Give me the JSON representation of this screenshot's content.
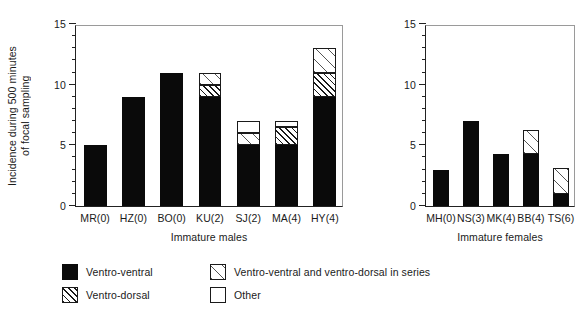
{
  "chart_data": {
    "type": "bar",
    "subtype": "stacked",
    "title": "",
    "xlabel": "",
    "ylabel": "Incidence during 500 minutes\nof focal sampling",
    "ylim": [
      0,
      15
    ],
    "ytick_values": [
      0,
      5,
      10,
      15
    ],
    "ytick_labels": [
      "0",
      "5",
      "10",
      "15"
    ],
    "ytick_minor_step": 1,
    "grid": false,
    "legend_position": "bottom-left",
    "series": [
      {
        "name": "Ventro-ventral",
        "key": "vv",
        "pattern": "solid-black",
        "color": "#0a0a0a"
      },
      {
        "name": "Ventro-dorsal",
        "key": "vd",
        "pattern": "dense-diagonal-hatch",
        "color": "#ffffff"
      },
      {
        "name": "Ventro-ventral and ventro-dorsal in series",
        "key": "series",
        "pattern": "sparse-diagonal-hatch",
        "color": "#ffffff"
      },
      {
        "name": "Other",
        "key": "other",
        "pattern": "open-white",
        "color": "#ffffff"
      }
    ],
    "panels": [
      {
        "panel_label": "Immature males",
        "categories": [
          "MR(0)",
          "HZ(0)",
          "BO(0)",
          "KU(2)",
          "SJ(2)",
          "MA(4)",
          "HY(4)"
        ],
        "stacks": [
          {
            "category": "MR(0)",
            "vv": 5,
            "vd": 0,
            "series": 0,
            "other": 0,
            "total": 5
          },
          {
            "category": "HZ(0)",
            "vv": 9,
            "vd": 0,
            "series": 0,
            "other": 0,
            "total": 9
          },
          {
            "category": "BO(0)",
            "vv": 11,
            "vd": 0,
            "series": 0,
            "other": 0,
            "total": 11
          },
          {
            "category": "KU(2)",
            "vv": 9,
            "vd": 1,
            "series": 1,
            "other": 0,
            "total": 11
          },
          {
            "category": "SJ(2)",
            "vv": 5,
            "vd": 0,
            "series": 1,
            "other": 1,
            "total": 7
          },
          {
            "category": "MA(4)",
            "vv": 5,
            "vd": 1.5,
            "series": 0,
            "other": 0.5,
            "total": 7
          },
          {
            "category": "HY(4)",
            "vv": 9,
            "vd": 2,
            "series": 2,
            "other": 0,
            "total": 13
          }
        ]
      },
      {
        "panel_label": "Immature females",
        "categories": [
          "MH(0)",
          "NS(3)",
          "MK(4)",
          "BB(4)",
          "TS(6)"
        ],
        "stacks": [
          {
            "category": "MH(0)",
            "vv": 3,
            "vd": 0,
            "series": 0,
            "other": 0,
            "total": 3
          },
          {
            "category": "NS(3)",
            "vv": 7,
            "vd": 0,
            "series": 0,
            "other": 0,
            "total": 7
          },
          {
            "category": "MK(4)",
            "vv": 4.3,
            "vd": 0,
            "series": 0,
            "other": 0,
            "total": 4.3
          },
          {
            "category": "BB(4)",
            "vv": 4.3,
            "vd": 0,
            "series": 2,
            "other": 0,
            "total": 6.3
          },
          {
            "category": "TS(6)",
            "vv": 1,
            "vd": 0,
            "series": 2.1,
            "other": 0,
            "total": 3.1
          }
        ]
      }
    ]
  },
  "axes": {
    "y_title": "Incidence during 500 minutes\nof focal sampling",
    "y_ticks": [
      "15",
      "10",
      "5",
      "0"
    ],
    "left_panel_title": "Immature males",
    "right_panel_title": "Immature females",
    "left_categories": [
      "MR(0)",
      "HZ(0)",
      "BO(0)",
      "KU(2)",
      "SJ(2)",
      "MA(4)",
      "HY(4)"
    ],
    "right_categories": [
      "MH(0)",
      "NS(3)",
      "MK(4)",
      "BB(4)",
      "TS(6)"
    ]
  },
  "legend": {
    "items": [
      {
        "label": "Ventro-ventral",
        "swatch": "vv"
      },
      {
        "label": "Ventro-dorsal",
        "swatch": "vd"
      },
      {
        "label": "Ventro-ventral and ventro-dorsal in series",
        "swatch": "series"
      },
      {
        "label": "Other",
        "swatch": "other"
      }
    ]
  },
  "colors": {
    "ink": "#1a1a1a",
    "solid_fill": "#0a0a0a",
    "frame_light": "#9a9a9a",
    "background": "#ffffff"
  }
}
